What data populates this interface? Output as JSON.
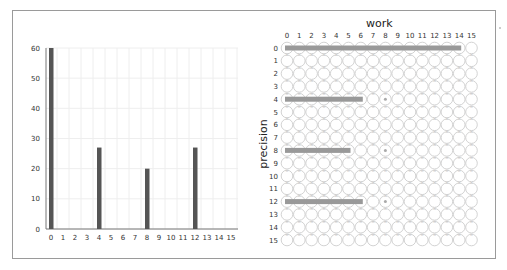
{
  "chart_data": [
    {
      "type": "bar",
      "title": "",
      "xlabel": "",
      "ylabel": "",
      "categories": [
        "0",
        "1",
        "2",
        "3",
        "4",
        "5",
        "6",
        "7",
        "8",
        "9",
        "10",
        "11",
        "12",
        "13",
        "14",
        "15"
      ],
      "values": [
        60,
        0,
        0,
        0,
        27,
        0,
        0,
        0,
        20,
        0,
        0,
        0,
        27,
        0,
        0,
        0
      ],
      "yticks": [
        0,
        10,
        20,
        30,
        40,
        50,
        60
      ],
      "ylim": [
        0,
        60
      ],
      "grid": true,
      "bar_color": "#555555"
    },
    {
      "type": "heatmap",
      "title": "",
      "xlabel": "work",
      "ylabel": "precision",
      "x": [
        "0",
        "1",
        "2",
        "3",
        "4",
        "5",
        "6",
        "7",
        "8",
        "9",
        "10",
        "11",
        "12",
        "13",
        "14",
        "15"
      ],
      "y": [
        "0",
        "1",
        "2",
        "3",
        "4",
        "5",
        "6",
        "7",
        "8",
        "9",
        "10",
        "11",
        "12",
        "13",
        "14",
        "15"
      ],
      "spans": [
        {
          "row": 0,
          "from": 0,
          "to": 14
        },
        {
          "row": 4,
          "from": 0,
          "to": 6
        },
        {
          "row": 8,
          "from": 0,
          "to": 5
        },
        {
          "row": 12,
          "from": 0,
          "to": 6
        }
      ],
      "dots": [
        {
          "row": 4,
          "col": 8
        },
        {
          "row": 8,
          "col": 8
        },
        {
          "row": 12,
          "col": 8
        }
      ],
      "span_color": "#999999",
      "circle_color": "#c8c8c8"
    }
  ]
}
